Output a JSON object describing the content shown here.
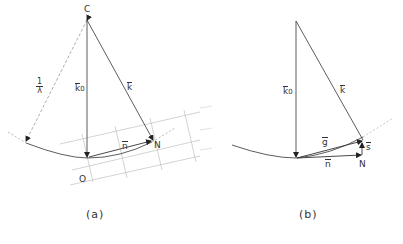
{
  "figure_a": {
    "caption": "(a)",
    "labels": {
      "center": "C",
      "origin": "O",
      "node": "N",
      "k0": "k",
      "k0_sub": "0",
      "k": "k",
      "n": "n",
      "radius_num": "1",
      "radius_den": "λ"
    }
  },
  "figure_b": {
    "caption": "(b)",
    "labels": {
      "k0": "k",
      "k0_sub": "0",
      "k": "k",
      "g": "g",
      "n": "n",
      "s": "s",
      "node": "N"
    }
  },
  "colors": {
    "line": "#333333",
    "lattice": "#aaaaaa",
    "dashed": "#999999"
  }
}
